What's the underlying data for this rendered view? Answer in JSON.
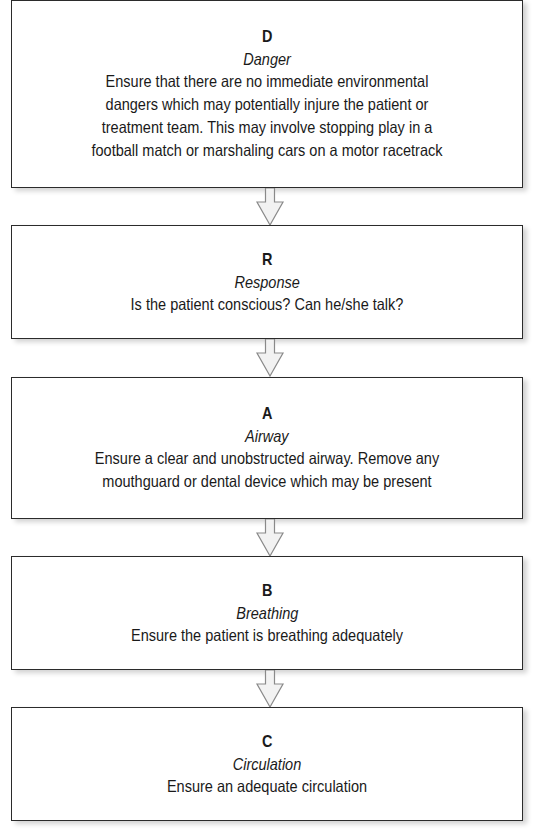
{
  "flowchart": {
    "steps": [
      {
        "letter": "D",
        "title": "Danger",
        "description": "Ensure that there are no immediate environmental\ndangers which may potentially injure the patient or\ntreatment team. This may involve stopping play in a\nfootball match or marshaling cars on a motor racetrack"
      },
      {
        "letter": "R",
        "title": "Response",
        "description": "Is the patient conscious? Can he/she talk?"
      },
      {
        "letter": "A",
        "title": "Airway",
        "description": "Ensure a clear and unobstructed airway. Remove any\nmouthguard or dental device which may be present"
      },
      {
        "letter": "B",
        "title": "Breathing",
        "description": "Ensure the patient is breathing adequately"
      },
      {
        "letter": "C",
        "title": "Circulation",
        "description": "Ensure an adequate circulation"
      }
    ],
    "arrow_icon": "down-arrow-icon",
    "colors": {
      "box_border": "#2b2b2b",
      "arrow_fill": "#f2f2f2",
      "arrow_stroke": "#8a8a8a"
    }
  }
}
